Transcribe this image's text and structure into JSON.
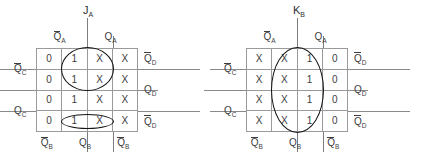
{
  "page": {
    "kind": "karnaugh-map-pair",
    "background": "#ffffff",
    "ink": "#3d3d3d",
    "grid_line_color": "#9a9a9a",
    "loop_color": "#141414"
  },
  "maps": [
    {
      "id": "left",
      "title": "J",
      "title_sub": "A",
      "col_labels": [
        {
          "text": "Q",
          "sub": "A",
          "overbar": true
        },
        {
          "text": "Q",
          "sub": "A",
          "overbar": false
        }
      ],
      "bottom_labels": [
        {
          "text": "Q",
          "sub": "B",
          "overbar": true
        },
        {
          "text": "Q",
          "sub": "B",
          "overbar": false
        },
        {
          "text": "Q",
          "sub": "B",
          "overbar": true
        }
      ],
      "left_labels": [
        {
          "text": "Q",
          "sub": "C",
          "overbar": true
        },
        {
          "text": "Q",
          "sub": "C",
          "overbar": false
        }
      ],
      "right_labels": [
        {
          "text": "Q",
          "sub": "D",
          "overbar": true
        },
        {
          "text": "Q",
          "sub": "D",
          "overbar": false
        },
        {
          "text": "Q",
          "sub": "D",
          "overbar": true
        }
      ],
      "cells": [
        [
          "0",
          "1",
          "X",
          "X"
        ],
        [
          "0",
          "1",
          "X",
          "X"
        ],
        [
          "0",
          "1",
          "X",
          "X"
        ],
        [
          "0",
          "1",
          "X",
          "X"
        ]
      ],
      "loops": [
        {
          "name": "group-circle-top",
          "shape": "circle",
          "cols": [
            1,
            2
          ],
          "rows": [
            0,
            1
          ]
        },
        {
          "name": "group-ellipse-bottom",
          "shape": "ellipse",
          "cols": [
            1,
            2
          ],
          "rows": [
            3,
            3
          ]
        }
      ]
    },
    {
      "id": "right",
      "title": "K",
      "title_sub": "B",
      "col_labels": [
        {
          "text": "Q",
          "sub": "A",
          "overbar": true
        },
        {
          "text": "Q",
          "sub": "A",
          "overbar": false
        }
      ],
      "bottom_labels": [
        {
          "text": "Q",
          "sub": "B",
          "overbar": true
        },
        {
          "text": "Q",
          "sub": "B",
          "overbar": false
        },
        {
          "text": "Q",
          "sub": "B",
          "overbar": true
        }
      ],
      "left_labels": [
        {
          "text": "Q",
          "sub": "C",
          "overbar": true
        },
        {
          "text": "Q",
          "sub": "C",
          "overbar": false
        }
      ],
      "right_labels": [
        {
          "text": "Q",
          "sub": "D",
          "overbar": true
        },
        {
          "text": "Q",
          "sub": "D",
          "overbar": false
        },
        {
          "text": "Q",
          "sub": "D",
          "overbar": true
        }
      ],
      "cells": [
        [
          "X",
          "X",
          "1",
          "0"
        ],
        [
          "X",
          "X",
          "1",
          "0"
        ],
        [
          "X",
          "X",
          "1",
          "0"
        ],
        [
          "X",
          "X",
          "1",
          "0"
        ]
      ],
      "loops": [
        {
          "name": "group-ellipse-tall",
          "shape": "ellipse",
          "cols": [
            1,
            2
          ],
          "rows": [
            0,
            3
          ]
        }
      ]
    }
  ]
}
